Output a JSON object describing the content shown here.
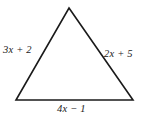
{
  "figure": {
    "type": "triangle-diagram",
    "background_color": "#ffffff",
    "stroke_color": "#1a1a1a",
    "stroke_width": 1.6,
    "text_color": "#1a1a1a",
    "vertices": {
      "apex": {
        "x": 69,
        "y": 8
      },
      "bottom_left": {
        "x": 16,
        "y": 100
      },
      "bottom_right": {
        "x": 133,
        "y": 100
      }
    },
    "labels": {
      "left_side": "3x + 2",
      "right_side": "2x + 5",
      "base": "4x − 1"
    }
  }
}
